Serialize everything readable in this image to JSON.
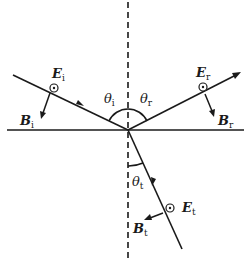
{
  "diagram": {
    "colors": {
      "stroke": "#1a1a1a",
      "background": "#ffffff"
    },
    "interface": {
      "label": "interface"
    },
    "normal": {
      "label": "normal",
      "style": "dashed"
    },
    "angles": {
      "incident": {
        "symbol": "θ",
        "sub": "i"
      },
      "reflected": {
        "symbol": "θ",
        "sub": "r"
      },
      "transmitted": {
        "symbol": "θ",
        "sub": "t"
      }
    },
    "rays": {
      "incident": {
        "E": {
          "symbol": "E",
          "sub": "i",
          "direction": "out-of-page"
        },
        "B": {
          "symbol": "B",
          "sub": "i"
        }
      },
      "reflected": {
        "E": {
          "symbol": "E",
          "sub": "r",
          "direction": "out-of-page"
        },
        "B": {
          "symbol": "B",
          "sub": "r"
        }
      },
      "transmitted": {
        "E": {
          "symbol": "E",
          "sub": "t",
          "direction": "out-of-page"
        },
        "B": {
          "symbol": "B",
          "sub": "t"
        }
      }
    }
  }
}
